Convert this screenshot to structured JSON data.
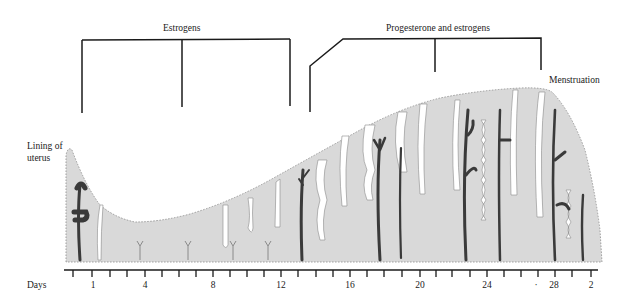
{
  "figure": {
    "hormone_phases": [
      {
        "label": "Estrogens",
        "start_day": 1,
        "end_day": 13
      },
      {
        "label": "Progesterone and estrogens",
        "start_day": 14,
        "end_day": 27
      }
    ],
    "annotations": {
      "lining": "Lining of uterus",
      "lining_line1": "Lining of",
      "lining_line2": "uterus",
      "menstruation": "Menstruation"
    },
    "axis": {
      "label": "Days",
      "tick_labels": [
        {
          "text": "1",
          "x": 93
        },
        {
          "text": "4",
          "x": 145
        },
        {
          "text": "8",
          "x": 213
        },
        {
          "text": "12",
          "x": 281
        },
        {
          "text": "16",
          "x": 350
        },
        {
          "text": "20",
          "x": 420
        },
        {
          "text": "24",
          "x": 487
        },
        {
          "text": "·",
          "x": 536
        },
        {
          "text": "28",
          "x": 554
        },
        {
          "text": "2",
          "x": 591
        }
      ]
    },
    "colors": {
      "tissue": "#d9d9d9",
      "tissue_edge": "#8a8a8a",
      "gland": "#ffffff",
      "vessel": "#3a3a3a",
      "line": "#1a1a1a"
    }
  }
}
